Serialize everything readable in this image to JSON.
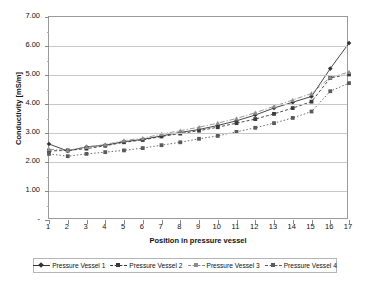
{
  "chart_data": {
    "type": "line",
    "title": "",
    "xlabel": "Position in pressure vessel",
    "ylabel": "Conductivity [mS/m]",
    "x": [
      1,
      2,
      3,
      4,
      5,
      6,
      7,
      8,
      9,
      10,
      11,
      12,
      13,
      14,
      15,
      16,
      17
    ],
    "xtick_labels": [
      "1",
      "2",
      "3",
      "4",
      "5",
      "6",
      "7",
      "8",
      "9",
      "10",
      "11",
      "12",
      "13",
      "14",
      "15",
      "16",
      "17"
    ],
    "ytick_labels": [
      "-",
      "1.00",
      "2.00",
      "3.00",
      "4.00",
      "5.00",
      "6.00",
      "7.00"
    ],
    "ytick_values": [
      0,
      1,
      2,
      3,
      4,
      5,
      6,
      7
    ],
    "ylim": [
      0,
      7
    ],
    "xlim": [
      1,
      17
    ],
    "grid": true,
    "legend_position": "bottom",
    "series": [
      {
        "name": "Pressure Vessel 1",
        "color": "#333333",
        "dash": "none",
        "marker": "diamond",
        "values": [
          2.62,
          2.38,
          2.52,
          2.58,
          2.7,
          2.78,
          2.9,
          3.02,
          3.12,
          3.26,
          3.42,
          3.62,
          3.86,
          4.06,
          4.26,
          5.22,
          6.1
        ]
      },
      {
        "name": "Pressure Vessel 2",
        "color": "#3a3a3a",
        "dash": "dashed",
        "marker": "square",
        "values": [
          2.38,
          2.4,
          2.46,
          2.56,
          2.68,
          2.76,
          2.88,
          2.98,
          3.08,
          3.2,
          3.34,
          3.48,
          3.66,
          3.86,
          4.08,
          4.9,
          5.02
        ]
      },
      {
        "name": "Pressure Vessel 3",
        "color": "#8c8c8c",
        "dash": "dashdot",
        "marker": "triangle",
        "values": [
          2.44,
          2.4,
          2.52,
          2.6,
          2.74,
          2.82,
          2.96,
          3.08,
          3.2,
          3.34,
          3.5,
          3.7,
          3.92,
          4.14,
          4.36,
          4.92,
          5.1
        ]
      },
      {
        "name": "Pressure Vessel 4",
        "color": "#5a5a5a",
        "dash": "dashdot2",
        "marker": "square",
        "values": [
          2.28,
          2.2,
          2.28,
          2.34,
          2.4,
          2.48,
          2.58,
          2.68,
          2.8,
          2.9,
          3.04,
          3.18,
          3.34,
          3.52,
          3.74,
          4.44,
          4.72
        ]
      }
    ]
  },
  "legend": {
    "items": [
      {
        "label": "Pressure Vessel 1"
      },
      {
        "label": "Pressure Vessel 2"
      },
      {
        "label": "Pressure Vessel 3"
      },
      {
        "label": "Pressure Vessel 4"
      }
    ]
  }
}
